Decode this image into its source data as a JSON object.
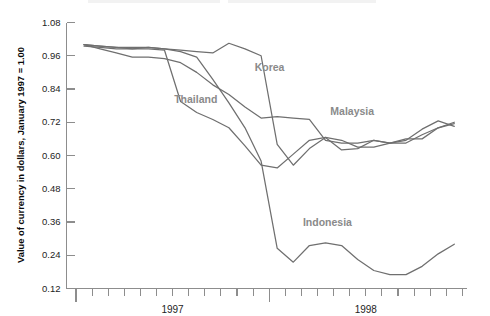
{
  "chart_data": {
    "type": "line",
    "title": "",
    "xlabel": "",
    "ylabel": "Value of currency in dollars, January 1997 = 1.00",
    "ylim": [
      0.12,
      1.08
    ],
    "ytick_labels": [
      "1.08",
      "0.96",
      "0.84",
      "0.72",
      "0.60",
      "0.48",
      "0.36",
      "0.24",
      "0.12"
    ],
    "ytick_values": [
      1.08,
      0.96,
      0.84,
      0.72,
      0.6,
      0.48,
      0.36,
      0.24,
      0.12
    ],
    "xtick_labels": [
      "1997",
      "1998"
    ],
    "x_axis_note": "Monthly ticks from January 1997 through December 1998; long ticks mark year boundaries",
    "grid": false,
    "legend_position": "inline-labels",
    "x": [
      "1997-01",
      "1997-02",
      "1997-03",
      "1997-04",
      "1997-05",
      "1997-06",
      "1997-07",
      "1997-08",
      "1997-09",
      "1997-10",
      "1997-11",
      "1997-12",
      "1998-01",
      "1998-02",
      "1998-03",
      "1998-04",
      "1998-05",
      "1998-06",
      "1998-07",
      "1998-08",
      "1998-09",
      "1998-10",
      "1998-11",
      "1998-12"
    ],
    "series": [
      {
        "name": "Korea",
        "color": "#6f6f6f",
        "label_x_index": 10.6,
        "label_y_value": 0.915,
        "values": [
          1.0,
          0.995,
          0.99,
          0.99,
          0.99,
          0.985,
          0.98,
          0.975,
          0.97,
          1.005,
          0.985,
          0.96,
          0.64,
          0.565,
          0.625,
          0.665,
          0.655,
          0.63,
          0.63,
          0.645,
          0.655,
          0.695,
          0.725,
          0.705
        ]
      },
      {
        "name": "Thailand",
        "color": "#6f6f6f",
        "label_x_index": 5.6,
        "label_y_value": 0.8,
        "values": [
          1.0,
          0.995,
          0.99,
          0.985,
          0.985,
          0.98,
          0.795,
          0.755,
          0.73,
          0.7,
          0.635,
          0.565,
          0.555,
          0.605,
          0.655,
          0.665,
          0.62,
          0.625,
          0.655,
          0.645,
          0.645,
          0.675,
          0.7,
          0.72
        ]
      },
      {
        "name": "Malaysia",
        "color": "#6f6f6f",
        "label_x_index": 15.3,
        "label_y_value": 0.755,
        "values": [
          1.0,
          0.985,
          0.97,
          0.955,
          0.955,
          0.95,
          0.935,
          0.9,
          0.855,
          0.82,
          0.775,
          0.735,
          0.74,
          0.735,
          0.73,
          0.655,
          0.645,
          0.645,
          0.655,
          0.645,
          0.66,
          0.66,
          0.7,
          0.715
        ]
      },
      {
        "name": "Indonesia",
        "color": "#6f6f6f",
        "label_x_index": 13.6,
        "label_y_value": 0.355,
        "values": [
          0.995,
          0.99,
          0.985,
          0.985,
          0.99,
          0.985,
          0.975,
          0.955,
          0.875,
          0.79,
          0.7,
          0.58,
          0.265,
          0.215,
          0.275,
          0.285,
          0.275,
          0.225,
          0.185,
          0.17,
          0.17,
          0.2,
          0.245,
          0.28
        ]
      }
    ]
  },
  "axis": {
    "y_title": "Value of currency in dollars, January 1997 = 1.00",
    "year_label_1997": "1997",
    "year_label_1998": "1998"
  }
}
